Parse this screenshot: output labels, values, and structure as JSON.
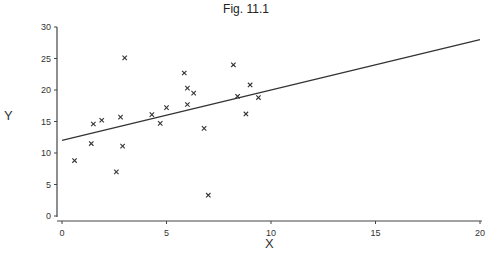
{
  "chart_data": {
    "type": "scatter",
    "title": "Fig. 11.1",
    "xlabel": "X",
    "ylabel": "Y",
    "xlim": [
      0,
      20
    ],
    "ylim": [
      0,
      30
    ],
    "xticks": [
      0,
      5,
      10,
      15,
      20
    ],
    "yticks": [
      0,
      5,
      10,
      15,
      20,
      25,
      30
    ],
    "grid": false,
    "legend": null,
    "marker": "x",
    "series": [
      {
        "name": "observations",
        "points": [
          [
            0.6,
            8.8
          ],
          [
            1.4,
            11.5
          ],
          [
            1.5,
            14.6
          ],
          [
            1.9,
            15.2
          ],
          [
            2.6,
            7.0
          ],
          [
            2.8,
            15.7
          ],
          [
            2.9,
            11.1
          ],
          [
            3.0,
            25.1
          ],
          [
            4.3,
            16.1
          ],
          [
            4.7,
            14.7
          ],
          [
            5.0,
            17.2
          ],
          [
            5.85,
            22.7
          ],
          [
            6.0,
            20.3
          ],
          [
            6.0,
            17.7
          ],
          [
            6.3,
            19.5
          ],
          [
            6.8,
            13.9
          ],
          [
            7.0,
            3.3
          ],
          [
            8.2,
            24.0
          ],
          [
            8.4,
            19.0
          ],
          [
            8.8,
            16.2
          ],
          [
            9.0,
            20.8
          ],
          [
            9.4,
            18.8
          ]
        ]
      }
    ],
    "fit_line": {
      "name": "regression line",
      "intercept": 12,
      "slope": 0.8,
      "from": [
        0,
        12
      ],
      "to": [
        20,
        28
      ]
    }
  },
  "colors": {
    "axis": "#444444",
    "marker": "#333333",
    "line": "#333333"
  }
}
